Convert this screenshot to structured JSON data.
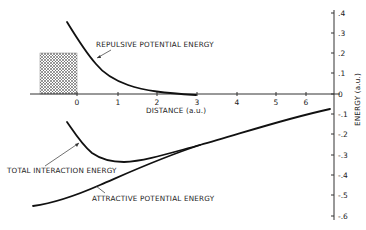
{
  "chart_data": {
    "type": "line",
    "title": "",
    "xlabel": "DISTANCE (a.u.)",
    "ylabel": "ENERGY (a.u.)",
    "xlim": [
      -1.2,
      6.6
    ],
    "ylim": [
      -0.6,
      0.4
    ],
    "x_ticks": [
      "0",
      "1",
      "2",
      "3",
      "4",
      "5",
      "6"
    ],
    "y_ticks": [
      ".4",
      ".3",
      ".2",
      ".1",
      "0",
      "-.1",
      "-.2",
      "-.3",
      "-.4",
      "-.5",
      "-.6"
    ],
    "grid": false,
    "legend": "none (inline annotations with arrows)",
    "series": [
      {
        "name": "REPULSIVE POTENTIAL ENERGY",
        "x": [
          -0.25,
          0.0,
          0.5,
          1.0,
          1.5,
          2.0,
          2.5,
          3.0
        ],
        "y": [
          0.35,
          0.27,
          0.14,
          0.07,
          0.035,
          0.015,
          0.005,
          0.0
        ]
      },
      {
        "name": "TOTAL INTERACTION ENERGY",
        "x": [
          -0.25,
          0.0,
          0.5,
          1.0,
          1.5,
          2.0,
          3.0,
          4.0,
          5.0,
          6.0,
          6.6
        ],
        "y": [
          -0.14,
          -0.2,
          -0.29,
          -0.33,
          -0.33,
          -0.31,
          -0.25,
          -0.2,
          -0.15,
          -0.11,
          -0.08
        ]
      },
      {
        "name": "ATTRACTIVE POTENTIAL ENERGY",
        "x": [
          -1.1,
          -0.5,
          0.0,
          0.5,
          1.0,
          2.0,
          3.0,
          4.0,
          5.0,
          6.0,
          6.6
        ],
        "y": [
          -0.55,
          -0.53,
          -0.49,
          -0.45,
          -0.41,
          -0.33,
          -0.26,
          -0.2,
          -0.15,
          -0.11,
          -0.08
        ]
      }
    ],
    "annotations": [
      {
        "text": "REPULSIVE POTENTIAL ENERGY",
        "points_to": "repulsive curve near x=0.5"
      },
      {
        "text": "TOTAL INTERACTION ENERGY",
        "points_to": "total curve near x=0.1"
      },
      {
        "text": "ATTRACTIVE POTENTIAL ENERGY",
        "points_to": "attractive curve near x=0.5"
      }
    ],
    "shaded_region": {
      "x": [
        -0.95,
        0.0
      ],
      "y": [
        0.0,
        0.2
      ],
      "pattern": "crosshatch"
    }
  },
  "labels": {
    "repulsive": "REPULSIVE POTENTIAL ENERGY",
    "total": "TOTAL INTERACTION ENERGY",
    "attractive": "ATTRACTIVE POTENTIAL ENERGY",
    "xaxis": "DISTANCE (a.u.)",
    "yaxis": "ENERGY (a.u.)"
  },
  "xticks": [
    {
      "label": "0",
      "px": 77
    },
    {
      "label": "1",
      "px": 118
    },
    {
      "label": "2",
      "px": 157
    },
    {
      "label": "3",
      "px": 197
    },
    {
      "label": "4",
      "px": 237
    },
    {
      "label": "5",
      "px": 276
    },
    {
      "label": "6",
      "px": 306
    }
  ],
  "yticks": [
    {
      "label": ".4",
      "py": 13
    },
    {
      "label": ".3",
      "py": 33
    },
    {
      "label": ".2",
      "py": 53
    },
    {
      "label": ".1",
      "py": 73
    },
    {
      "label": "0",
      "py": 94
    },
    {
      "label": "-.1",
      "py": 114
    },
    {
      "label": "-.2",
      "py": 134
    },
    {
      "label": "-.3",
      "py": 155
    },
    {
      "label": "-.4",
      "py": 175
    },
    {
      "label": "-.5",
      "py": 195
    },
    {
      "label": "-.6",
      "py": 216
    }
  ]
}
